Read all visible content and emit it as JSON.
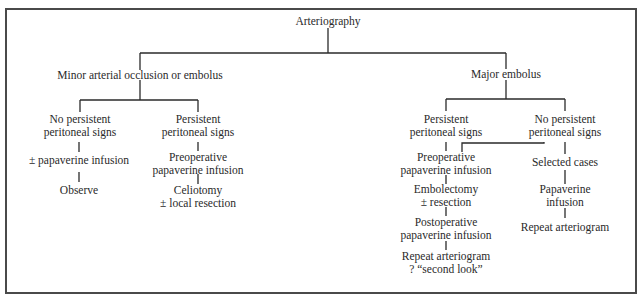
{
  "diagram": {
    "type": "flowchart",
    "root": {
      "label": "Arteriography"
    },
    "branches": [
      {
        "id": "minor",
        "label": "Minor arterial occlusion or embolus",
        "children": [
          {
            "id": "minor-no-persistent",
            "label_lines": [
              "No persistent",
              "peritoneal signs"
            ],
            "steps": [
              {
                "label_lines": [
                  "± papaverine infusion"
                ]
              },
              {
                "label_lines": [
                  "Observe"
                ]
              }
            ]
          },
          {
            "id": "minor-persistent",
            "label_lines": [
              "Persistent",
              "peritoneal signs"
            ],
            "steps": [
              {
                "label_lines": [
                  "Preoperative",
                  "papaverine infusion"
                ]
              },
              {
                "label_lines": [
                  "Celiotomy",
                  "± local resection"
                ]
              }
            ]
          }
        ]
      },
      {
        "id": "major",
        "label": "Major embolus",
        "children": [
          {
            "id": "major-persistent",
            "label_lines": [
              "Persistent",
              "peritoneal signs"
            ],
            "steps": [
              {
                "label_lines": [
                  "Preoperative",
                  "papaverine infusion"
                ]
              },
              {
                "label_lines": [
                  "Embolectomy",
                  "± resection"
                ]
              },
              {
                "label_lines": [
                  "Postoperative",
                  "papaverine infusion"
                ]
              },
              {
                "label_lines": [
                  "Repeat arteriogram",
                  "? “second look”"
                ]
              }
            ]
          },
          {
            "id": "major-no-persistent",
            "label_lines": [
              "No persistent",
              "peritoneal signs"
            ],
            "cross_link_to": "major-persistent.steps.0",
            "steps": [
              {
                "label_lines": [
                  "Selected cases"
                ]
              },
              {
                "label_lines": [
                  "Papaverine",
                  "infusion"
                ]
              },
              {
                "label_lines": [
                  "Repeat arteriogram"
                ]
              }
            ]
          }
        ]
      }
    ]
  },
  "colors": {
    "line": "#2a2a2a",
    "text": "#2a2a2a",
    "frame": "#4a4a4a",
    "background": "#ffffff"
  }
}
